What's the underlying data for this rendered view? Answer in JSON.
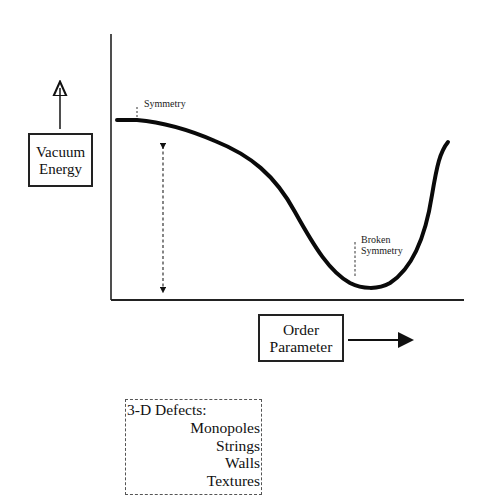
{
  "diagram": {
    "type": "potential-energy-curve",
    "y_axis_label": {
      "line1": "Vacuum",
      "line2": "Energy"
    },
    "x_axis_label": {
      "line1": "Order",
      "line2": "Parameter"
    },
    "annotations": {
      "symmetry": "Symmetry",
      "broken_symmetry": {
        "line1": "Broken",
        "line2": "Symmetry"
      }
    },
    "defects_box": {
      "title": "3-D Defects:",
      "items": [
        "Monopoles",
        "Strings",
        "Walls",
        "Textures"
      ]
    },
    "colors": {
      "ink": "#111111",
      "background": "#ffffff"
    }
  }
}
